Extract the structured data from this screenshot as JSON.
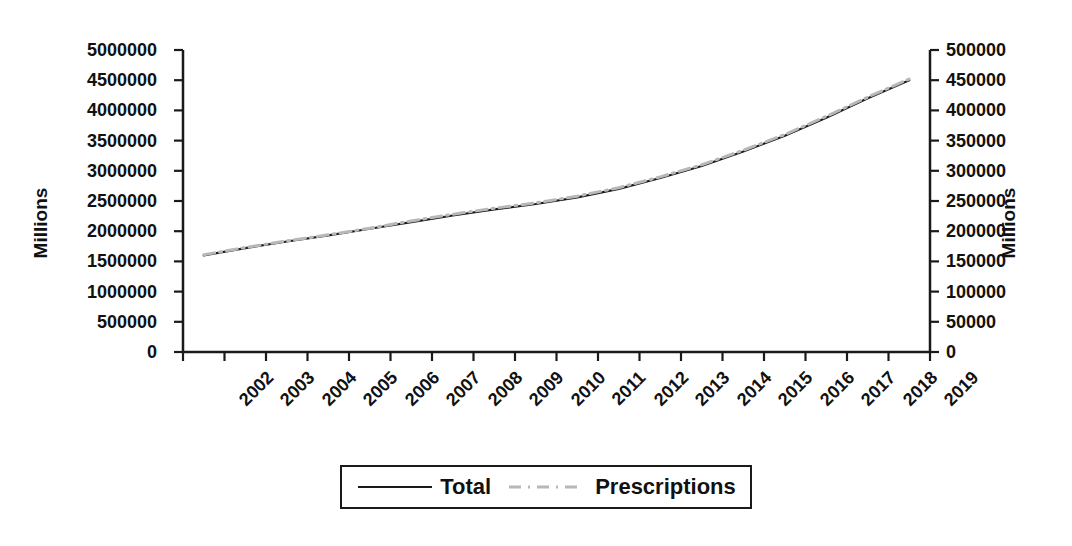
{
  "chart_data": {
    "type": "line",
    "title": "",
    "subtitle": "",
    "xlabel": "",
    "ylabel": "Millions",
    "ylabel_secondary": "Millions",
    "grid": false,
    "legend_position": "bottom",
    "categories": [
      "2002",
      "2003",
      "2004",
      "2005",
      "2006",
      "2007",
      "2008",
      "2009",
      "2010",
      "2011",
      "2012",
      "2013",
      "2014",
      "2015",
      "2016",
      "2017",
      "2018",
      "2019"
    ],
    "yaxis_left": {
      "label": "Millions",
      "min": 0,
      "max": 5000000,
      "step": 500000,
      "ticks": [
        "0",
        "500000",
        "1000000",
        "1500000",
        "2000000",
        "2500000",
        "3000000",
        "3500000",
        "4000000",
        "4500000",
        "5000000"
      ],
      "tick_values": [
        0,
        500000,
        1000000,
        1500000,
        2000000,
        2500000,
        3000000,
        3500000,
        4000000,
        4500000,
        5000000
      ]
    },
    "yaxis_right": {
      "label": "Millions",
      "min": 0,
      "max": 500000,
      "step": 50000,
      "ticks": [
        "0",
        "50000",
        "100000",
        "150000",
        "200000",
        "250000",
        "300000",
        "350000",
        "400000",
        "450000",
        "500000"
      ],
      "tick_values": [
        0,
        50000,
        100000,
        150000,
        200000,
        250000,
        300000,
        350000,
        400000,
        450000,
        500000
      ]
    },
    "series": [
      {
        "name": "Total",
        "axis": "left",
        "style": "solid",
        "color": "#1a1a1a",
        "values": [
          1600000,
          1720000,
          1830000,
          1930000,
          2040000,
          2150000,
          2260000,
          2360000,
          2450000,
          2560000,
          2700000,
          2880000,
          3080000,
          3320000,
          3580000,
          3880000,
          4200000,
          4500000
        ]
      },
      {
        "name": "Prescriptions",
        "axis": "right",
        "style": "dash-dot",
        "color": "#b8b8b8",
        "values": [
          161000,
          173000,
          184000,
          194000,
          205000,
          217000,
          228000,
          238000,
          247000,
          258000,
          272000,
          290000,
          310000,
          334000,
          360000,
          390000,
          422000,
          452000
        ]
      }
    ]
  },
  "legend": {
    "items": [
      {
        "label": "Total",
        "swatch": "solid-line-swatch"
      },
      {
        "label": "Prescriptions",
        "swatch": "dash-dot-line-swatch"
      }
    ]
  },
  "colors": {
    "total_line": "#1a1a1a",
    "prescriptions_line": "#b8b8b8",
    "axis": "#1a1a1a",
    "background": "#ffffff"
  }
}
